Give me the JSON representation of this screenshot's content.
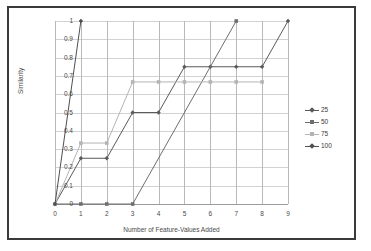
{
  "chart_data": {
    "type": "line",
    "title": "",
    "xlabel": "Number of Feature-Values Added",
    "ylabel": "Similarity",
    "x": [
      0,
      1,
      2,
      3,
      4,
      5,
      6,
      7,
      8,
      9
    ],
    "xlim": [
      0,
      9
    ],
    "ylim": [
      0,
      1
    ],
    "xticks": [
      "0",
      "1",
      "2",
      "3",
      "4",
      "5",
      "6",
      "7",
      "8",
      "9"
    ],
    "yticks": [
      "0",
      "0.1",
      "0.2",
      "0.3",
      "0.4",
      "0.5",
      "0.6",
      "0.7",
      "0.8",
      "0.9",
      "1"
    ],
    "grid": "horizontal",
    "legend_position": "right",
    "series": [
      {
        "name": "25",
        "color": "#5a5a5a",
        "marker": "diamond",
        "x": [
          0,
          1,
          2,
          3,
          4,
          5,
          6,
          7,
          8,
          9
        ],
        "values": [
          0,
          0.25,
          0.25,
          0.5,
          0.5,
          0.75,
          0.75,
          0.75,
          0.75,
          1
        ]
      },
      {
        "name": "50",
        "color": "#6e6e6e",
        "marker": "square",
        "x": [
          0,
          1,
          2,
          3,
          7
        ],
        "values": [
          0,
          0,
          0,
          0,
          1
        ]
      },
      {
        "name": "75",
        "color": "#b4b4b4",
        "marker": "square",
        "x": [
          0,
          1,
          2,
          3,
          4,
          5,
          6,
          7,
          8
        ],
        "values": [
          0,
          0.333,
          0.333,
          0.667,
          0.667,
          0.667,
          0.667,
          0.667,
          0.667
        ]
      },
      {
        "name": "100",
        "color": "#4f4f4f",
        "marker": "diamond",
        "x": [
          0,
          1
        ],
        "values": [
          0,
          1
        ]
      }
    ]
  },
  "legend": {
    "entries": [
      {
        "label": "25",
        "color": "#5a5a5a",
        "marker": "diamond"
      },
      {
        "label": "50",
        "color": "#6e6e6e",
        "marker": "square"
      },
      {
        "label": "75",
        "color": "#b4b4b4",
        "marker": "square"
      },
      {
        "label": "100",
        "color": "#4f4f4f",
        "marker": "diamond"
      }
    ]
  }
}
